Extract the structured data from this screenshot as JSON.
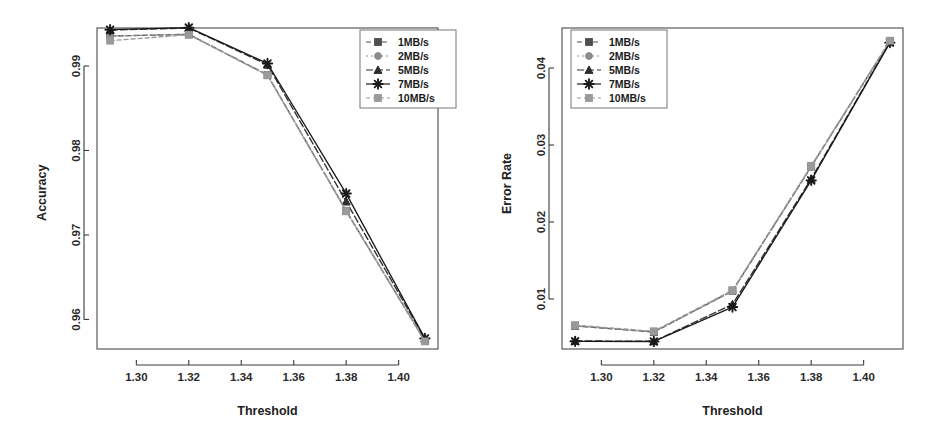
{
  "figure": {
    "background": "#ffffff",
    "panel_count": 2
  },
  "chart_data": [
    {
      "type": "line",
      "title": "",
      "xlabel": "Threshold",
      "ylabel": "Accuracy",
      "x": [
        1.29,
        1.32,
        1.35,
        1.38,
        1.41
      ],
      "xlim": [
        1.285,
        1.415
      ],
      "ylim": [
        0.9565,
        0.9945
      ],
      "xticks": [
        1.3,
        1.32,
        1.34,
        1.36,
        1.38,
        1.4
      ],
      "xticklabels": [
        "1.30",
        "1.32",
        "1.34",
        "1.36",
        "1.38",
        "1.40"
      ],
      "yticks": [
        0.96,
        0.97,
        0.98,
        0.99
      ],
      "yticklabels": [
        "0.96",
        "0.97",
        "0.98",
        "0.99"
      ],
      "grid": false,
      "legend_position": "top-right",
      "series": [
        {
          "name": "1MB/s",
          "marker": "square",
          "color": "#4f4f4f",
          "dash": "5,3",
          "values": [
            0.99355,
            0.99375,
            0.98895,
            0.97285,
            0.95745
          ]
        },
        {
          "name": "2MB/s",
          "marker": "circle",
          "color": "#8c8c8c",
          "dash": "2,3",
          "values": [
            0.99355,
            0.99375,
            0.98895,
            0.9729,
            0.95745
          ]
        },
        {
          "name": "5MB/s",
          "marker": "triangle",
          "color": "#2e2e2e",
          "dash": "7,3",
          "values": [
            0.99425,
            0.9945,
            0.99015,
            0.97395,
            0.9577
          ]
        },
        {
          "name": "7MB/s",
          "marker": "asterisk",
          "color": "#1a1a1a",
          "dash": "none",
          "values": [
            0.9943,
            0.99455,
            0.9903,
            0.9749,
            0.95775
          ]
        },
        {
          "name": "10MB/s",
          "marker": "square",
          "color": "#9a9a9a",
          "dash": "4,3",
          "values": [
            0.993,
            0.9937,
            0.9889,
            0.9728,
            0.9574
          ]
        }
      ]
    },
    {
      "type": "line",
      "title": "",
      "xlabel": "Threshold",
      "ylabel": "Error Rate",
      "x": [
        1.29,
        1.32,
        1.35,
        1.38,
        1.41
      ],
      "xlim": [
        1.285,
        1.415
      ],
      "ylim": [
        0.0035,
        0.0452
      ],
      "xticks": [
        1.3,
        1.32,
        1.34,
        1.36,
        1.38,
        1.4
      ],
      "xticklabels": [
        "1.30",
        "1.32",
        "1.34",
        "1.36",
        "1.38",
        "1.40"
      ],
      "yticks": [
        0.01,
        0.02,
        0.03,
        0.04
      ],
      "yticklabels": [
        "0.01",
        "0.02",
        "0.03",
        "0.04"
      ],
      "grid": false,
      "legend_position": "top-left",
      "series": [
        {
          "name": "1MB/s",
          "marker": "square",
          "color": "#4f4f4f",
          "dash": "5,3",
          "values": [
            0.0065,
            0.0057,
            0.01105,
            0.0272,
            0.0435
          ]
        },
        {
          "name": "2MB/s",
          "marker": "circle",
          "color": "#8c8c8c",
          "dash": "2,3",
          "values": [
            0.00648,
            0.00572,
            0.011,
            0.02715,
            0.04345
          ]
        },
        {
          "name": "5MB/s",
          "marker": "triangle",
          "color": "#2e2e2e",
          "dash": "7,3",
          "values": [
            0.00455,
            0.0045,
            0.0093,
            0.0256,
            0.04335
          ]
        },
        {
          "name": "7MB/s",
          "marker": "asterisk",
          "color": "#1a1a1a",
          "dash": "none",
          "values": [
            0.0045,
            0.00448,
            0.00895,
            0.0254,
            0.0433
          ]
        },
        {
          "name": "10MB/s",
          "marker": "square",
          "color": "#9a9a9a",
          "dash": "4,3",
          "values": [
            0.0066,
            0.0058,
            0.01115,
            0.0273,
            0.04355
          ]
        }
      ]
    }
  ],
  "panels": [
    {
      "id": "accuracy-panel",
      "ylabel": "Accuracy",
      "xlabel": "Threshold",
      "legend": {
        "items": [
          "1MB/s",
          "2MB/s",
          "5MB/s",
          "7MB/s",
          "10MB/s"
        ]
      }
    },
    {
      "id": "error-rate-panel",
      "ylabel": "Error Rate",
      "xlabel": "Threshold",
      "legend": {
        "items": [
          "1MB/s",
          "2MB/s",
          "5MB/s",
          "7MB/s",
          "10MB/s"
        ]
      }
    }
  ]
}
